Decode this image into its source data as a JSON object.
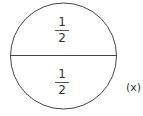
{
  "diagram": {
    "parts": [
      {
        "position": "top",
        "numerator": "1",
        "denominator": "2"
      },
      {
        "position": "bottom",
        "numerator": "1",
        "denominator": "2"
      }
    ],
    "label": "(x)",
    "stroke_color": "#444444"
  }
}
